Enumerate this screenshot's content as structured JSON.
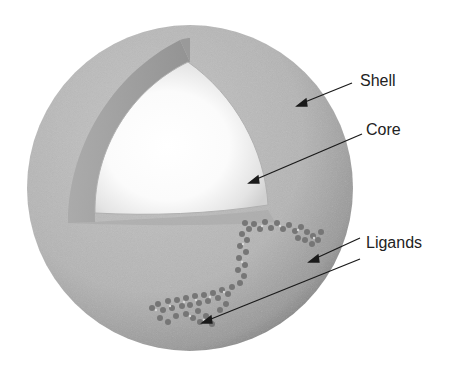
{
  "diagram": {
    "labels": {
      "shell": "Shell",
      "core": "Core",
      "ligands": "Ligands"
    },
    "colors": {
      "background": "#ffffff",
      "shell": "#b8b8b8",
      "shell_dark": "#8a8a8a",
      "core": "#ffffff",
      "ligand": "#6e6e6e",
      "arrow": "#1a1a1a",
      "text": "#222222"
    },
    "components": [
      "shell",
      "core",
      "ligands"
    ]
  }
}
